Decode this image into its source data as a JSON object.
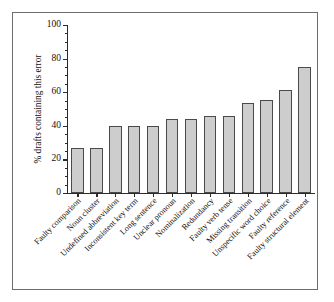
{
  "figure": {
    "background_color": "#ffffff",
    "frame_color": "#6d6d6d",
    "bar_fill_color": "#cdcdcd",
    "bar_edge_color": "#4a4a4a",
    "axis_color": "#2b2b2b"
  },
  "chart_data": {
    "type": "bar",
    "title": "",
    "xlabel": "",
    "ylabel": "% drafts containing this error",
    "ylim": [
      0,
      100
    ],
    "yticks": [
      0,
      20,
      40,
      60,
      80,
      100
    ],
    "ytick_labels": [
      "0",
      "20",
      "40",
      "60",
      "80",
      "100"
    ],
    "minor_tick_interval": 5,
    "grid": false,
    "legend": null,
    "categories": [
      "Faulty comparison",
      "Noun cluster",
      "Undefined abbreviation",
      "Inconsistent key term",
      "Long sentence",
      "Unclear pronoun",
      "Nominalization",
      "Redundancy",
      "Faulty verb tense",
      "Missing transition",
      "Unspecific word choice",
      "Faulty reference",
      "Faulty structural element"
    ],
    "values": [
      27,
      27,
      40,
      40,
      40,
      44,
      44,
      46,
      46,
      53.5,
      55.5,
      61.5,
      75
    ]
  }
}
